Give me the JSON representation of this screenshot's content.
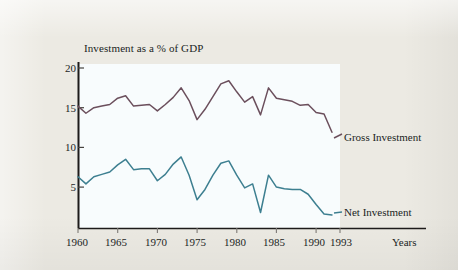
{
  "figure": {
    "page_background": "#eceae3",
    "plot_background": "#f8fcfd",
    "axis_color": "#1d1b1a"
  },
  "chart_data": {
    "type": "line",
    "title": "Investment as a % of GDP",
    "xlabel": "Years",
    "ylabel": "",
    "grid": false,
    "legend_position": "inline-right",
    "xlim": [
      1960,
      1993
    ],
    "ylim": [
      0,
      21
    ],
    "y_ticks": [
      20,
      15,
      10,
      5
    ],
    "y_tick_labels": [
      "20",
      "15",
      "10",
      "5"
    ],
    "x_ticks": [
      1960,
      1965,
      1970,
      1975,
      1980,
      1985,
      1990,
      1993
    ],
    "x_tick_labels": [
      "1960",
      "1965",
      "1970",
      "1975",
      "1980",
      "1985",
      "1990",
      "1993"
    ],
    "x": [
      1960,
      1961,
      1962,
      1963,
      1964,
      1965,
      1966,
      1967,
      1968,
      1969,
      1970,
      1971,
      1972,
      1973,
      1974,
      1975,
      1976,
      1977,
      1978,
      1979,
      1980,
      1981,
      1982,
      1983,
      1984,
      1985,
      1986,
      1987,
      1988,
      1989,
      1990,
      1991,
      1992
    ],
    "series": [
      {
        "name": "Gross Investment",
        "color": "#6b4f5c",
        "values": [
          15.2,
          14.3,
          15.0,
          15.2,
          15.4,
          16.2,
          16.5,
          15.2,
          15.3,
          15.4,
          14.6,
          15.4,
          16.3,
          17.5,
          15.9,
          13.5,
          14.8,
          16.4,
          18.0,
          18.4,
          17.0,
          15.7,
          16.4,
          14.1,
          17.5,
          16.2,
          16.0,
          15.8,
          15.3,
          15.4,
          14.4,
          14.2,
          11.9
        ]
      },
      {
        "name": "Net Investment",
        "color": "#3d7f90",
        "values": [
          6.3,
          5.4,
          6.3,
          6.6,
          6.9,
          7.8,
          8.5,
          7.2,
          7.3,
          7.3,
          5.8,
          6.6,
          7.9,
          8.8,
          6.5,
          3.4,
          4.7,
          6.5,
          8.0,
          8.3,
          6.5,
          4.9,
          5.4,
          1.8,
          6.5,
          5.0,
          4.8,
          4.7,
          4.7,
          4.1,
          2.8,
          1.6,
          1.5
        ]
      }
    ],
    "annotations": [
      {
        "text": "Gross Investment",
        "series": "Gross Investment"
      },
      {
        "text": "Net Investment",
        "series": "Net Investment"
      }
    ]
  }
}
